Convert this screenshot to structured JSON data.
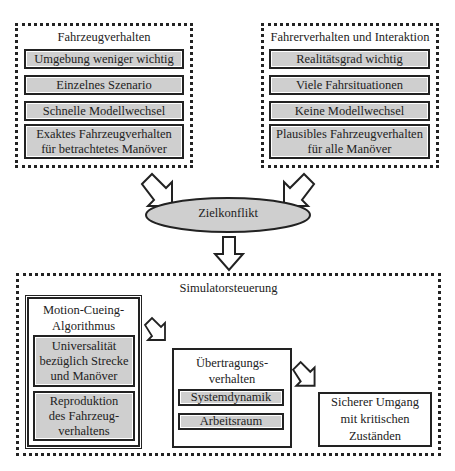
{
  "top_left": {
    "title": "Fahrzeugverhalten",
    "items": [
      "Umgebung weniger wichtig",
      "Einzelnes Szenario",
      "Schnelle Modellwechsel"
    ],
    "last_line1": "Exaktes Fahrzeugverhalten",
    "last_line2": "für betrachtetes Manöver"
  },
  "top_right": {
    "title": "Fahrerverhalten und Interaktion",
    "items": [
      "Realitätsgrad wichtig",
      "Viele Fahrsituationen",
      "Keine Modellwechsel"
    ],
    "last_line1": "Plausibles Fahrzeugverhalten",
    "last_line2": "für alle Manöver"
  },
  "conflict": {
    "label": "Zielkonflikt"
  },
  "bottom": {
    "title": "Simulatorsteuerung",
    "mca": {
      "title_line1": "Motion-Cueing-",
      "title_line2": "Algorithmus",
      "item1": [
        "Universalität",
        "bezüglich Strecke",
        "und Manöver"
      ],
      "item2": [
        "Reproduktion",
        "des Fahrzeug-",
        "verhaltens"
      ]
    },
    "transfer": {
      "title_line1": "Übertragungs-",
      "title_line2": "verhalten",
      "items": [
        "Systemdynamik",
        "Arbeitsraum"
      ]
    },
    "safety": [
      "Sicherer Umgang",
      "mit kritischen",
      "Zuständen"
    ]
  }
}
